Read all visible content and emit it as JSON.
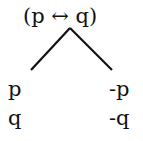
{
  "tree": {
    "root": "(p ↔ q)",
    "edges": [
      {
        "from": "root",
        "to": "left",
        "x1": 70,
        "y1": 28,
        "x2": 31,
        "y2": 70
      },
      {
        "from": "root",
        "to": "right",
        "x1": 70,
        "y1": 28,
        "x2": 112,
        "y2": 70
      }
    ],
    "left_branch": [
      "p",
      "q"
    ],
    "right_branch": [
      "-p",
      "-q"
    ]
  }
}
